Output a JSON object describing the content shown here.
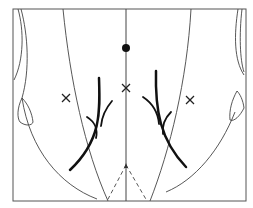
{
  "diagram": {
    "type": "anatomical-line-drawing",
    "background": "#ffffff",
    "stroke_color": "#3a3a3a",
    "ink_color": "#111111",
    "frame": {
      "x": 13,
      "y": 9,
      "width": 233,
      "height": 192
    },
    "markers": {
      "dot": {
        "x": 126,
        "y": 48,
        "r": 4
      },
      "crosses": [
        {
          "name": "center-cross",
          "x": 126,
          "y": 88
        },
        {
          "name": "left-cross",
          "x": 66,
          "y": 98
        },
        {
          "name": "right-cross",
          "x": 190,
          "y": 100
        }
      ]
    }
  }
}
